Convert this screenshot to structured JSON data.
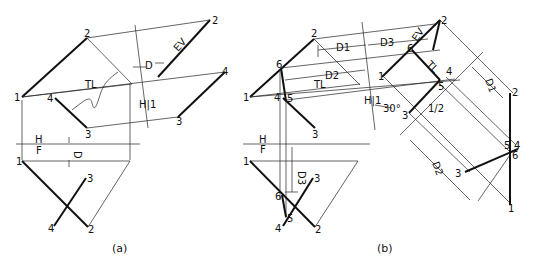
{
  "figure_a": {
    "caption": "(a)",
    "top_view": {
      "points": {
        "p1": "1",
        "p2": "2",
        "p3": "3",
        "p4": "4"
      },
      "labels": {
        "tl": "TL"
      }
    },
    "aux_view": {
      "points": {
        "p2": "2",
        "p3": "3",
        "p4": "4"
      },
      "labels": {
        "ev": "EV",
        "d": "D",
        "hi": "H|1"
      }
    },
    "fold_line": {
      "h": "H",
      "f": "F",
      "d": "D"
    },
    "front_view": {
      "points": {
        "p1": "1",
        "p2": "2",
        "p3": "3",
        "p4": "4"
      }
    }
  },
  "figure_b": {
    "caption": "(b)",
    "top_view": {
      "points": {
        "p1": "1",
        "p2": "2",
        "p3": "3",
        "p4": "4",
        "p5": "5",
        "p6": "6"
      },
      "labels": {
        "d1": "D1",
        "d2": "D2",
        "tl": "TL"
      }
    },
    "aux_view_1": {
      "points": {
        "p1": "1",
        "p2": "2",
        "p3": "3",
        "p4": "4",
        "p5": "5",
        "p6": "6"
      },
      "labels": {
        "d3": "D3",
        "ev": "EV",
        "tl": "TL",
        "hi": "H|1",
        "angle": "30°",
        "fold12": "1/2"
      }
    },
    "aux_view_2": {
      "points": {
        "p1": "1",
        "p2": "2",
        "p3": "3",
        "p4": "4",
        "p5": "5",
        "p6": "6"
      },
      "labels": {
        "d1": "D1",
        "d2": "D2"
      }
    },
    "fold_line": {
      "h": "H",
      "f": "F",
      "d3": "D3"
    },
    "front_view": {
      "points": {
        "p1": "1",
        "p2": "2",
        "p3": "3",
        "p4": "4",
        "p5": "5",
        "p6": "6"
      }
    }
  }
}
